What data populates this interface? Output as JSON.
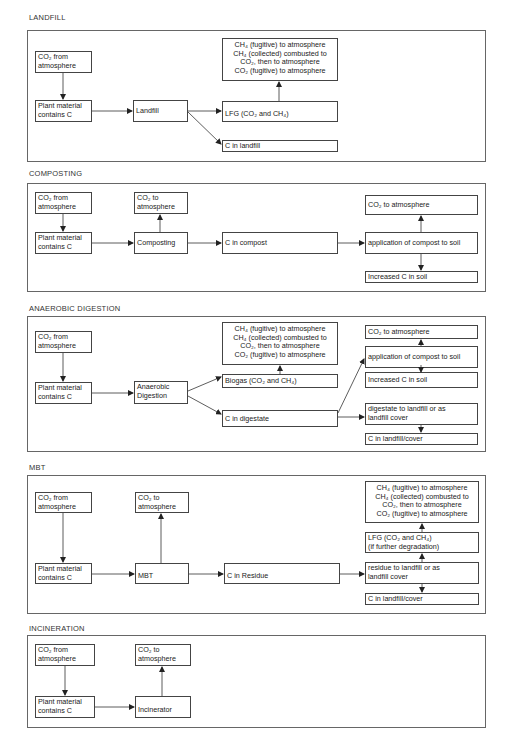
{
  "sections": {
    "landfill": {
      "title": "LANDFILL",
      "co2_from": [
        "CO₂ from",
        "atmosphere"
      ],
      "plant": [
        "Plant material",
        "contains C"
      ],
      "process": "Landfill",
      "gas_outcomes": [
        "CH₄ (fugitive) to atmosphere",
        "CH₄ (collected) combusted to",
        "CO₂, then to atmosphere",
        "CO₂ (fugitive) to atmosphere"
      ],
      "lfg": "LFG (CO₂ and CH₄)",
      "c_store": "C in landfill"
    },
    "composting": {
      "title": "COMPOSTING",
      "co2_from": [
        "CO₂ from",
        "atmosphere"
      ],
      "plant": [
        "Plant material",
        "contains C"
      ],
      "co2_to": [
        "CO₂ to",
        "atmosphere"
      ],
      "process": "Composting",
      "c_product": "C in compost",
      "co2_to_atm": "CO₂ to atmosphere",
      "application": "application of compost to soil",
      "increased_c": "Increased C in soil"
    },
    "anaerobic_digestion": {
      "title": "ANAEROBIC DIGESTION",
      "co2_from": [
        "CO₂ from",
        "atmosphere"
      ],
      "plant": [
        "Plant material",
        "contains C"
      ],
      "process": [
        "Anaerobic",
        "Digestion"
      ],
      "gas_outcomes": [
        "CH₄ (fugitive) to atmosphere",
        "CH₄ (collected) combusted to",
        "CO₂, then to atmosphere",
        "CO₂ (fugitive) to atmosphere"
      ],
      "biogas": "Biogas (CO₂ and CH₄)",
      "c_product": "C in digestate",
      "co2_to_atm": "CO₂ to atmosphere",
      "application": "application of compost to soil",
      "increased_c": "Increased C in soil",
      "to_landfill": [
        "digestate to landfill or as",
        "landfill cover"
      ],
      "c_landfill_cover": "C in landfill/cover"
    },
    "mbt": {
      "title": "MBT",
      "co2_from": [
        "CO₂ from",
        "atmosphere"
      ],
      "plant": [
        "Plant material",
        "contains C"
      ],
      "co2_to": [
        "CO₂ to",
        "atmosphere"
      ],
      "process": "MBT",
      "c_product": "C in Residue",
      "gas_outcomes": [
        "CH₄ (fugitive) to atmosphere",
        "CH₄ (collected) combusted to",
        "CO₂, then to atmosphere",
        "CO₂ (fugitive) to atmosphere"
      ],
      "lfg": [
        "LFG (CO₂ and CH₄)",
        "(if further degradation)"
      ],
      "to_landfill": [
        "residue to landfill or as",
        "landfill cover"
      ],
      "c_landfill_cover": "C in landfill/cover"
    },
    "incineration": {
      "title": "INCINERATION",
      "co2_from": [
        "CO₂ from",
        "atmosphere"
      ],
      "plant": [
        "Plant material",
        "contains C"
      ],
      "co2_to": [
        "CO₂ to",
        "atmosphere"
      ],
      "process": "Incinerator"
    }
  },
  "style": {
    "line_color": "#333333",
    "frame_color": "#666666",
    "background": "#ffffff"
  }
}
